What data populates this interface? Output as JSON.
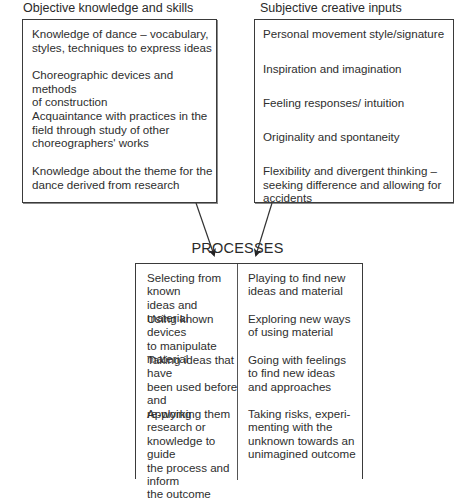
{
  "objective": {
    "heading": "Objective knowledge and skills",
    "items": [
      {
        "lines": [
          "Knowledge of dance – vocabulary,",
          "styles, techniques to express ideas"
        ]
      },
      {
        "lines": [
          "Choreographic devices and methods",
          "of construction"
        ]
      },
      {
        "lines": [
          "Acquaintance with practices in the",
          "field through study of other",
          "choreographers' works"
        ]
      },
      {
        "lines": [
          "Knowledge about the theme for the",
          "dance derived from research"
        ]
      }
    ]
  },
  "subjective": {
    "heading": "Subjective creative inputs",
    "items": [
      {
        "lines": [
          "Personal movement style/signature"
        ]
      },
      {
        "lines": [
          "Inspiration and imagination"
        ]
      },
      {
        "lines": [
          "Feeling responses/ intuition"
        ]
      },
      {
        "lines": [
          "Originality and spontaneity"
        ]
      },
      {
        "lines": [
          "Flexibility and divergent thinking –",
          "seeking difference and allowing for",
          "accidents"
        ]
      }
    ]
  },
  "processes": {
    "title": "PROCESSES",
    "left_column": [
      {
        "lines": [
          "Selecting from known",
          "ideas and material"
        ]
      },
      {
        "lines": [
          "Using known devices",
          "to manipulate material"
        ]
      },
      {
        "lines": [
          "Taking ideas that have",
          "been used before and",
          "re-working them"
        ]
      },
      {
        "lines": [
          "Applying research or",
          "knowledge to guide",
          "the process and inform",
          "the outcome"
        ]
      }
    ],
    "right_column": [
      {
        "lines": [
          "Playing to find new",
          "ideas and material"
        ]
      },
      {
        "lines": [
          "Exploring new ways",
          "of using material"
        ]
      },
      {
        "lines": [
          "Going with feelings",
          "to find new ideas",
          "and approaches"
        ]
      },
      {
        "lines": [
          "Taking risks, experi-",
          "menting with the",
          "unknown towards an",
          "unimagined outcome"
        ]
      }
    ]
  },
  "colors": {
    "line": "#3a3a3a",
    "text": "#2e2e2e",
    "background": "#ffffff"
  }
}
